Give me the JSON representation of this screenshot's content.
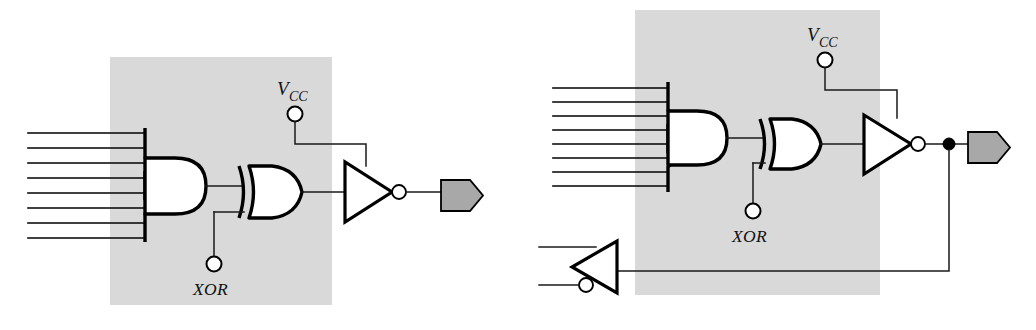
{
  "figure": {
    "canvas": {
      "width": 1036,
      "height": 330
    },
    "background_color": "#ffffff",
    "box_fill_color": "#d9d9d9",
    "wire_color": "#000000",
    "pad_fill_color": "#a8a8a8"
  },
  "labels": {
    "vcc_main": "V",
    "vcc_sub": "CC",
    "xor": "XOR"
  },
  "diagrams": [
    {
      "id": "left-macrocell",
      "name": "combinational-output-macrocell",
      "box": {
        "x": 110,
        "y": 57,
        "width": 222,
        "height": 248
      },
      "input_line_count": 8,
      "gates": [
        {
          "type": "and-array",
          "name": "and-gate"
        },
        {
          "type": "xor",
          "name": "xor-gate"
        },
        {
          "type": "tristate-inverter",
          "name": "output-inverter",
          "enable": "VCC"
        }
      ],
      "pins": [
        {
          "name": "vcc-pin",
          "label": "V_CC"
        },
        {
          "name": "xor-pin",
          "label": "XOR"
        }
      ],
      "output_pad": {
        "name": "output-pad"
      },
      "has_feedback": false
    },
    {
      "id": "right-macrocell",
      "name": "bidirectional-io-macrocell",
      "box": {
        "x": 635,
        "y": 10,
        "width": 245,
        "height": 285
      },
      "input_line_count": 8,
      "gates": [
        {
          "type": "and-array",
          "name": "and-gate"
        },
        {
          "type": "xor",
          "name": "xor-gate"
        },
        {
          "type": "tristate-inverter",
          "name": "output-inverter",
          "enable": "VCC"
        },
        {
          "type": "feedback-buffer",
          "name": "feedback-buffer"
        }
      ],
      "pins": [
        {
          "name": "vcc-pin",
          "label": "V_CC"
        },
        {
          "name": "xor-pin",
          "label": "XOR"
        }
      ],
      "output_pad": {
        "name": "output-pad"
      },
      "has_feedback": true,
      "junction_dots": 1
    }
  ]
}
